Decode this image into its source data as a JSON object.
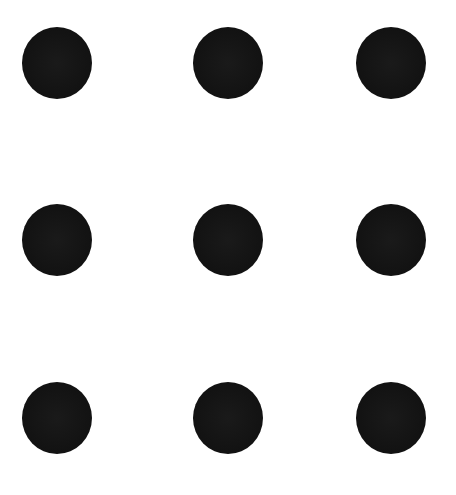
{
  "diagram": {
    "type": "dot-grid",
    "rows": 3,
    "cols": 3,
    "dot_color": "#121212",
    "background_color": "#ffffff",
    "dot_size": {
      "w": 70,
      "h": 72
    },
    "dots": [
      {
        "row": 0,
        "col": 0,
        "cx": 57,
        "cy": 63
      },
      {
        "row": 0,
        "col": 1,
        "cx": 228,
        "cy": 63
      },
      {
        "row": 0,
        "col": 2,
        "cx": 391,
        "cy": 63
      },
      {
        "row": 1,
        "col": 0,
        "cx": 57,
        "cy": 240
      },
      {
        "row": 1,
        "col": 1,
        "cx": 228,
        "cy": 240
      },
      {
        "row": 1,
        "col": 2,
        "cx": 391,
        "cy": 240
      },
      {
        "row": 2,
        "col": 0,
        "cx": 57,
        "cy": 418
      },
      {
        "row": 2,
        "col": 1,
        "cx": 228,
        "cy": 418
      },
      {
        "row": 2,
        "col": 2,
        "cx": 391,
        "cy": 418
      }
    ]
  }
}
